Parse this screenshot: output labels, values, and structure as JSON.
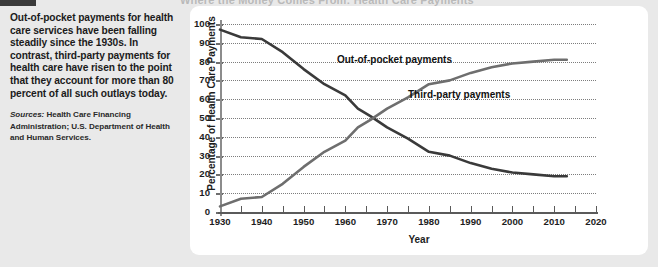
{
  "page": {
    "background": "#e9e9e9",
    "panel_background": "#ffffff",
    "cut_title": "Where the Money Comes From: Health Care Payments"
  },
  "sidebar": {
    "blurb": "Out-of-pocket payments for health care services have been falling steadily since the 1930s. In contrast, third-party payments for health care have risen to the point that they account for more than 80 percent of all such outlays today.",
    "sources_word": "Sources:",
    "sources_text": " Health Care Financing Administration; U.S. Department of Health and Human Services."
  },
  "chart_data": {
    "type": "line",
    "title": "",
    "xlabel": "Year",
    "ylabel": "Percentage of Health Care Payments",
    "xlim": [
      1930,
      2020
    ],
    "ylim": [
      0,
      100
    ],
    "grid": true,
    "legend": "inline-annotations",
    "xticks": [
      1930,
      1940,
      1950,
      1960,
      1970,
      1980,
      1990,
      2000,
      2010,
      2020
    ],
    "xminorticks": [
      1935,
      1945,
      1955,
      1965,
      1975,
      1985,
      1995,
      2005,
      2015
    ],
    "yticks": [
      0,
      10,
      20,
      30,
      40,
      50,
      60,
      70,
      80,
      90,
      100
    ],
    "x": [
      1930,
      1935,
      1940,
      1945,
      1950,
      1955,
      1960,
      1963,
      1966,
      1970,
      1975,
      1980,
      1985,
      1990,
      1995,
      2000,
      2005,
      2010,
      2013
    ],
    "series": [
      {
        "name": "Out-of-pocket payments",
        "color": "#3a3a3a",
        "label_x": 1958,
        "label_y": 81,
        "values": [
          97,
          93,
          92,
          85,
          76,
          68,
          62,
          55,
          51,
          45,
          39,
          32,
          30,
          26,
          23,
          21,
          20,
          19,
          19
        ]
      },
      {
        "name": "Third-party payments",
        "color": "#6e6e6e",
        "label_x": 1975,
        "label_y": 62,
        "values": [
          3,
          7,
          8,
          15,
          24,
          32,
          38,
          45,
          49,
          55,
          61,
          68,
          70,
          74,
          77,
          79,
          80,
          81,
          81
        ]
      }
    ],
    "annotations": [
      {
        "text": "Out-of-pocket payments",
        "x": 1958,
        "y": 81
      },
      {
        "text": "Third-party payments",
        "x": 1975,
        "y": 62
      }
    ]
  }
}
